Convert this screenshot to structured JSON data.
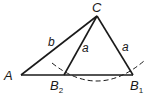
{
  "diagram": {
    "type": "geometry-triangle-ambiguous-case",
    "colors": {
      "stroke": "#1a1a1a",
      "background": "#ffffff"
    },
    "vertices": {
      "A": {
        "label": "A",
        "x": 21,
        "y": 75
      },
      "C": {
        "label": "C",
        "x": 97,
        "y": 16
      },
      "B1": {
        "label": "B",
        "subscript": "1",
        "x": 133,
        "y": 75
      },
      "B2": {
        "label": "B",
        "subscript": "2",
        "x": 64,
        "y": 75
      }
    },
    "sides": {
      "AC": {
        "label": "b"
      },
      "CB2": {
        "label": "a"
      },
      "CB1": {
        "label": "a"
      }
    },
    "arc": {
      "style": "dashed",
      "center": "C",
      "radius_label": "a"
    }
  }
}
